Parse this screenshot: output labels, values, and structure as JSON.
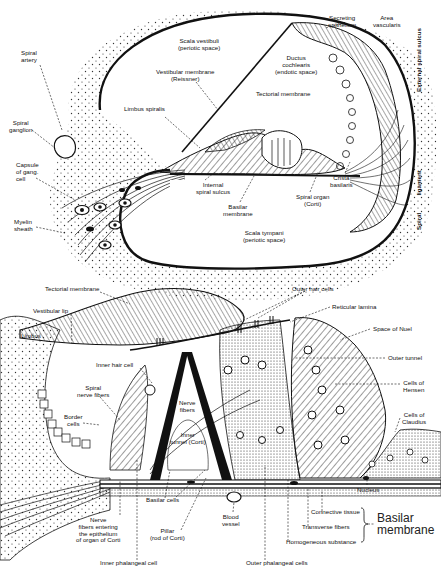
{
  "figure": {
    "top_panel": {
      "labels": [
        {
          "id": "spiral-artery",
          "text": "Spiral\nartery",
          "x": 21,
          "y": 50
        },
        {
          "id": "spiral-ganglion",
          "text": "Spiral\nganglion",
          "x": 9,
          "y": 120
        },
        {
          "id": "capsule-gang-cell",
          "text": "Capsule\nof gang.\ncell",
          "x": 16,
          "y": 162
        },
        {
          "id": "myelin-sheath",
          "text": "Myelin\nsheath",
          "x": 14,
          "y": 219
        },
        {
          "id": "scala-vestibuli",
          "text": "Scala vestibuli\n(periotic space)",
          "x": 178,
          "y": 38
        },
        {
          "id": "vestibular-membrane",
          "text": "Vestibular membrane\n(Reissner)",
          "x": 156,
          "y": 69
        },
        {
          "id": "limbus-spiralis",
          "text": "Limbus spiralis",
          "x": 124,
          "y": 106
        },
        {
          "id": "secreting-epithelium",
          "text": "Secreting\nepithelium",
          "x": 328,
          "y": 15
        },
        {
          "id": "area-vascularis",
          "text": "Area\nvascularis",
          "x": 373,
          "y": 15
        },
        {
          "id": "ductus-cochlearis",
          "text": "Ductus\ncochlearis\n(endotic space)",
          "x": 275,
          "y": 55
        },
        {
          "id": "tectorial-membrane-top",
          "text": "Tectorial membrane",
          "x": 256,
          "y": 91
        },
        {
          "id": "internal-spiral-sulcus",
          "text": "Internal\nspiral sulcus",
          "x": 196,
          "y": 182
        },
        {
          "id": "basilar-membrane-top",
          "text": "Basilar\nmembrane",
          "x": 223,
          "y": 204
        },
        {
          "id": "spiral-organ",
          "text": "Spiral organ\n(Corti)",
          "x": 296,
          "y": 194
        },
        {
          "id": "crista-basilaris",
          "text": "Crista\nbasilaris",
          "x": 330,
          "y": 175
        },
        {
          "id": "scala-tympani",
          "text": "Scala tympani\n(periotic space)",
          "x": 243,
          "y": 230
        }
      ],
      "vertical_labels": [
        {
          "id": "external-spiral-sulcus",
          "text": "External spiral sulcus",
          "x": 416,
          "y": 92
        },
        {
          "id": "spiral-ligament",
          "text": "Spiral          ligament",
          "x": 416,
          "y": 230
        }
      ]
    },
    "bottom_panel": {
      "labels": [
        {
          "id": "tectorial-membrane-bottom",
          "text": "Tectorial membrane",
          "x": 45,
          "y": 286
        },
        {
          "id": "vestibular-lip",
          "text": "Vestibular lip",
          "x": 33,
          "y": 308
        },
        {
          "id": "limbus",
          "text": "Limbus",
          "x": 21,
          "y": 333
        },
        {
          "id": "inner-hair-cell",
          "text": "Inner hair cell",
          "x": 96,
          "y": 362
        },
        {
          "id": "spiral-nerve-fibers",
          "text": "Spiral\nnerve fibers",
          "x": 77,
          "y": 385
        },
        {
          "id": "border-cells",
          "text": "Border\ncells",
          "x": 64,
          "y": 414
        },
        {
          "id": "nerve-fibers",
          "text": "Nerve\nfibers",
          "x": 179,
          "y": 400
        },
        {
          "id": "inner-tunnel",
          "text": "Inner\ntunnel (Corti)",
          "x": 183,
          "y": 432
        },
        {
          "id": "outer-hair-cells",
          "text": "Outer hair cells",
          "x": 292,
          "y": 286
        },
        {
          "id": "reticular-lamina",
          "text": "Reticular lamina",
          "x": 332,
          "y": 304
        },
        {
          "id": "space-of-nuel",
          "text": "Space of Nuel",
          "x": 373,
          "y": 326
        },
        {
          "id": "outer-tunnel",
          "text": "Outer tunnel",
          "x": 388,
          "y": 355
        },
        {
          "id": "cells-of-hensen",
          "text": "Cells of\nHensen",
          "x": 403,
          "y": 380
        },
        {
          "id": "cells-of-claudius",
          "text": "Cells of\nClaudius",
          "x": 402,
          "y": 412
        },
        {
          "id": "basilar-cells",
          "text": "Basilar cells",
          "x": 167,
          "y": 497
        },
        {
          "id": "nerve-fibers-entering",
          "text": "Nerve\nfibers entering\nthe epithelium\nof organ of Corti",
          "x": 108,
          "y": 517
        },
        {
          "id": "pillar",
          "text": "Pillar\n(rod of Corti)",
          "x": 176,
          "y": 528
        },
        {
          "id": "inner-phalangeal-cell",
          "text": "Inner phalangeal cell",
          "x": 134,
          "y": 560
        },
        {
          "id": "blood-vessel",
          "text": "Blood\nvessel",
          "x": 229,
          "y": 514
        },
        {
          "id": "nucleus",
          "text": "Nucleus",
          "x": 365,
          "y": 487
        },
        {
          "id": "connective-tissue",
          "text": "Connective tissue",
          "x": 311,
          "y": 509
        },
        {
          "id": "transverse-fibers",
          "text": "Transverse fibers",
          "x": 302,
          "y": 524
        },
        {
          "id": "homogeneous-substance",
          "text": "Homogeneous substance",
          "x": 286,
          "y": 539
        },
        {
          "id": "outer-phalangeal-cells",
          "text": "Outer phalangeal cells",
          "x": 246,
          "y": 560
        }
      ],
      "group_label": {
        "id": "basilar-membrane-bottom",
        "text": "Basilar\nmembrane",
        "x": 372,
        "y": 518
      }
    }
  }
}
